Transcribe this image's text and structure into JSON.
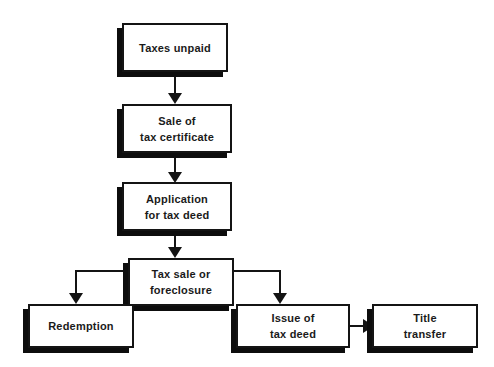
{
  "diagram": {
    "background_color": "#ffffff",
    "line_color": "#141414",
    "shadow_color": "#0d0d0d",
    "box_fill_color": "#ffffff",
    "text_color": "#1a1a1a",
    "nodes": [
      {
        "id": "taxes-unpaid",
        "label": "Taxes unpaid"
      },
      {
        "id": "sale-of-tax-certificate",
        "label": "Sale of\ntax certificate"
      },
      {
        "id": "application-for-tax-deed",
        "label": "Application\nfor tax deed"
      },
      {
        "id": "tax-sale-or-foreclosure",
        "label": "Tax sale or\nforeclosure"
      },
      {
        "id": "redemption",
        "label": "Redemption"
      },
      {
        "id": "issue-of-tax-deed",
        "label": "Issue of\ntax deed"
      },
      {
        "id": "title-transfer",
        "label": "Title\ntransfer"
      }
    ],
    "edges": [
      {
        "from": "taxes-unpaid",
        "to": "sale-of-tax-certificate",
        "direction": "down"
      },
      {
        "from": "sale-of-tax-certificate",
        "to": "application-for-tax-deed",
        "direction": "down"
      },
      {
        "from": "application-for-tax-deed",
        "to": "tax-sale-or-foreclosure",
        "direction": "down"
      },
      {
        "from": "tax-sale-or-foreclosure",
        "to": "redemption",
        "direction": "left-down"
      },
      {
        "from": "tax-sale-or-foreclosure",
        "to": "issue-of-tax-deed",
        "direction": "right-down"
      },
      {
        "from": "issue-of-tax-deed",
        "to": "title-transfer",
        "direction": "right"
      }
    ]
  }
}
